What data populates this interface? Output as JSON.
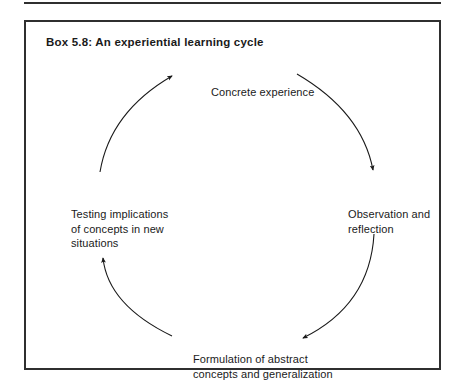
{
  "page": {
    "background_color": "#ffffff",
    "ink_color": "#1a1a1a",
    "rule_color": "#2f2f2f"
  },
  "previous_box": {
    "note": "bottom rule of the preceding box, clipped by the page top"
  },
  "box": {
    "title": "Box 5.8:  An experiential learning cycle",
    "border_color": "#2f2f2f"
  },
  "diagram": {
    "type": "cycle",
    "stages": [
      {
        "id": "concrete-experience",
        "position": "top",
        "lines": [
          "Concrete experience"
        ]
      },
      {
        "id": "observation-and-reflection",
        "position": "right",
        "lines": [
          "Observation and",
          "reflection"
        ]
      },
      {
        "id": "formulation-of-abstract-concepts",
        "position": "bottom",
        "lines": [
          "Formulation of abstract",
          "concepts and generalization"
        ]
      },
      {
        "id": "testing-implications",
        "position": "left",
        "lines": [
          "Testing implications",
          "of concepts in new",
          "situations"
        ]
      }
    ],
    "arrows": [
      {
        "id": "arrow-top-to-right",
        "from": "concrete-experience",
        "to": "observation-and-reflection",
        "direction": "clockwise"
      },
      {
        "id": "arrow-right-to-bottom",
        "from": "observation-and-reflection",
        "to": "formulation-of-abstract-concepts",
        "direction": "clockwise"
      },
      {
        "id": "arrow-bottom-to-left",
        "from": "formulation-of-abstract-concepts",
        "to": "testing-implications",
        "direction": "clockwise"
      },
      {
        "id": "arrow-left-to-top",
        "from": "testing-implications",
        "to": "concrete-experience",
        "direction": "clockwise"
      }
    ]
  }
}
